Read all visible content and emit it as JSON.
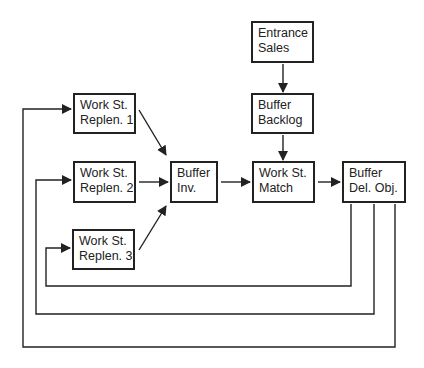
{
  "diagram": {
    "nodes": [
      {
        "id": "entrance_sales",
        "lines": [
          "Entrance",
          "Sales"
        ],
        "x": 251,
        "y": 21,
        "w": 63,
        "h": 42
      },
      {
        "id": "buffer_backlog",
        "lines": [
          "Buffer",
          "Backlog"
        ],
        "x": 251,
        "y": 93,
        "w": 63,
        "h": 41
      },
      {
        "id": "ws_replen_1",
        "lines": [
          "Work St.",
          "Replen. 1"
        ],
        "x": 73,
        "y": 93,
        "w": 63,
        "h": 41
      },
      {
        "id": "ws_replen_2",
        "lines": [
          "Work St.",
          "Replen. 2"
        ],
        "x": 73,
        "y": 161,
        "w": 63,
        "h": 42
      },
      {
        "id": "ws_replen_3",
        "lines": [
          "Work St.",
          "Replen. 3"
        ],
        "x": 72,
        "y": 229,
        "w": 63,
        "h": 41
      },
      {
        "id": "buffer_inv",
        "lines": [
          "Buffer",
          "Inv."
        ],
        "x": 170,
        "y": 161,
        "w": 48,
        "h": 42
      },
      {
        "id": "ws_match",
        "lines": [
          "Work St.",
          "Match"
        ],
        "x": 252,
        "y": 161,
        "w": 63,
        "h": 42
      },
      {
        "id": "buffer_del_obj",
        "lines": [
          "Buffer",
          "Del. Obj."
        ],
        "x": 342,
        "y": 161,
        "w": 64,
        "h": 42
      }
    ],
    "edges": [
      {
        "from": "entrance_sales",
        "to": "buffer_backlog"
      },
      {
        "from": "buffer_backlog",
        "to": "ws_match"
      },
      {
        "from": "ws_replen_1",
        "to": "buffer_inv"
      },
      {
        "from": "ws_replen_2",
        "to": "buffer_inv"
      },
      {
        "from": "ws_replen_3",
        "to": "buffer_inv"
      },
      {
        "from": "buffer_inv",
        "to": "ws_match"
      },
      {
        "from": "ws_match",
        "to": "buffer_del_obj"
      },
      {
        "from": "buffer_del_obj",
        "to": "ws_replen_3",
        "type": "feedback"
      },
      {
        "from": "buffer_del_obj",
        "to": "ws_replen_2",
        "type": "feedback"
      },
      {
        "from": "buffer_del_obj",
        "to": "ws_replen_1",
        "type": "feedback"
      }
    ],
    "colors": {
      "line": "#222222",
      "background": "#ffffff"
    }
  }
}
